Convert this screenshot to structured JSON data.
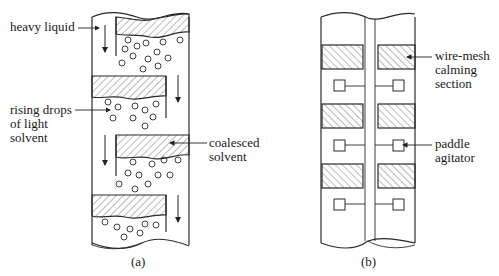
{
  "figure": {
    "panel_a": {
      "caption": "(a)",
      "labels": {
        "heavy_liquid": "heavy liquid",
        "rising_drops": "rising drops\nof light\nsolvent",
        "coalesced_solvent": "coalesced\nsolvent"
      }
    },
    "panel_b": {
      "caption": "(b)",
      "labels": {
        "wire_mesh": "wire-mesh\ncalming\nsection",
        "paddle_agitator": "paddle\nagitator"
      }
    }
  },
  "colors": {
    "line": "#2a2a2a",
    "background": "#ffffff"
  }
}
